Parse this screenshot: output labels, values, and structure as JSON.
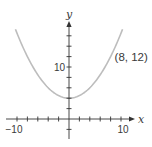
{
  "chart_data": {
    "type": "line",
    "title": "",
    "xlabel": "x",
    "ylabel": "y",
    "function": "y = x^2/8 + 4",
    "xlim": [
      -10.3,
      10.3
    ],
    "ylim": [
      -4,
      19
    ],
    "x_ticks_step": 2,
    "y_ticks_step": 2,
    "x_tick_labels": [
      {
        "value": -10,
        "label": "−10"
      },
      {
        "value": 10,
        "label": "10"
      }
    ],
    "y_tick_labels": [
      {
        "value": 10,
        "label": "10"
      }
    ],
    "grid": false,
    "legend": null,
    "series": [
      {
        "name": "parabola",
        "color": "#bdbdbd",
        "x": [
          -10.3,
          -8,
          -6,
          -4,
          -2,
          0,
          2,
          4,
          6,
          8,
          10.3
        ],
        "y": [
          17.26,
          12,
          8.5,
          6,
          4.5,
          4,
          4.5,
          6,
          8.5,
          12,
          17.26
        ]
      }
    ],
    "vertex": {
      "x": 0,
      "y": 4
    },
    "annotations": [
      {
        "type": "point",
        "x": 8,
        "y": 12,
        "label": "(8, 12)"
      }
    ]
  },
  "colors": {
    "axis": "#333333",
    "curve": "#bdbdbd",
    "text": "#3a3a3a"
  }
}
